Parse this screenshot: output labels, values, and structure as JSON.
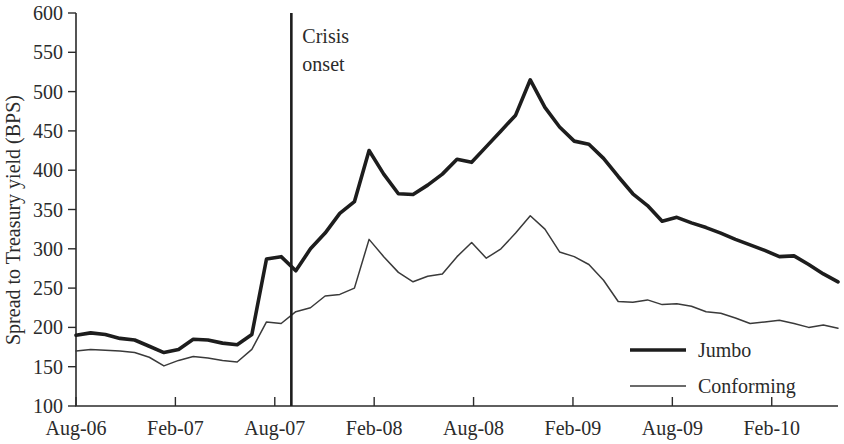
{
  "chart_data": {
    "type": "line",
    "title": "",
    "xlabel": "",
    "ylabel": "Spread to Treasury yield (BPS)",
    "ylim": [
      100,
      600
    ],
    "ytick_labels": [
      "100",
      "150",
      "200",
      "250",
      "300",
      "350",
      "400",
      "450",
      "500",
      "550",
      "600"
    ],
    "yticks": [
      100,
      150,
      200,
      250,
      300,
      350,
      400,
      450,
      500,
      550,
      600
    ],
    "xtick_labels": [
      "Aug-06",
      "Feb-07",
      "Aug-07",
      "Feb-08",
      "Aug-08",
      "Feb-09",
      "Aug-09",
      "Feb-10"
    ],
    "xticks": [
      0,
      6,
      12,
      18,
      24,
      30,
      36,
      42
    ],
    "x_index_max": 46,
    "grid": false,
    "legend_position": "bottom-right",
    "annotations": [
      {
        "name": "crisis-onset",
        "text_line1": "Crisis",
        "text_line2": "onset",
        "x_index": 13,
        "type": "vertical-line"
      }
    ],
    "series": [
      {
        "name": "Jumbo",
        "color": "#1d1d1d",
        "line_width": "thick",
        "values": [
          190,
          193,
          191,
          186,
          184,
          176,
          168,
          172,
          185,
          184,
          180,
          178,
          191,
          287,
          290,
          272,
          300,
          320,
          345,
          360,
          425,
          395,
          370,
          369,
          381,
          395,
          414,
          410,
          430,
          450,
          470,
          515,
          480,
          455,
          437,
          433,
          415,
          392,
          370,
          355,
          335,
          340,
          333,
          327,
          320,
          312,
          305,
          298,
          290,
          291,
          280,
          268,
          258
        ]
      },
      {
        "name": "Conforming",
        "color": "#3a3a3a",
        "line_width": "thin",
        "values": [
          170,
          172,
          171,
          170,
          168,
          162,
          151,
          158,
          163,
          161,
          158,
          156,
          172,
          207,
          205,
          220,
          225,
          240,
          242,
          250,
          312,
          290,
          270,
          258,
          265,
          268,
          290,
          308,
          288,
          300,
          320,
          342,
          325,
          296,
          290,
          280,
          260,
          233,
          232,
          235,
          229,
          230,
          227,
          220,
          218,
          212,
          205,
          207,
          209,
          205,
          200,
          203,
          199
        ]
      }
    ]
  },
  "legend": {
    "entries": [
      {
        "label": "Jumbo",
        "style": "thick"
      },
      {
        "label": "Conforming",
        "style": "thin"
      }
    ]
  },
  "axes": {
    "y_title": "Spread to Treasury yield (BPS)"
  }
}
